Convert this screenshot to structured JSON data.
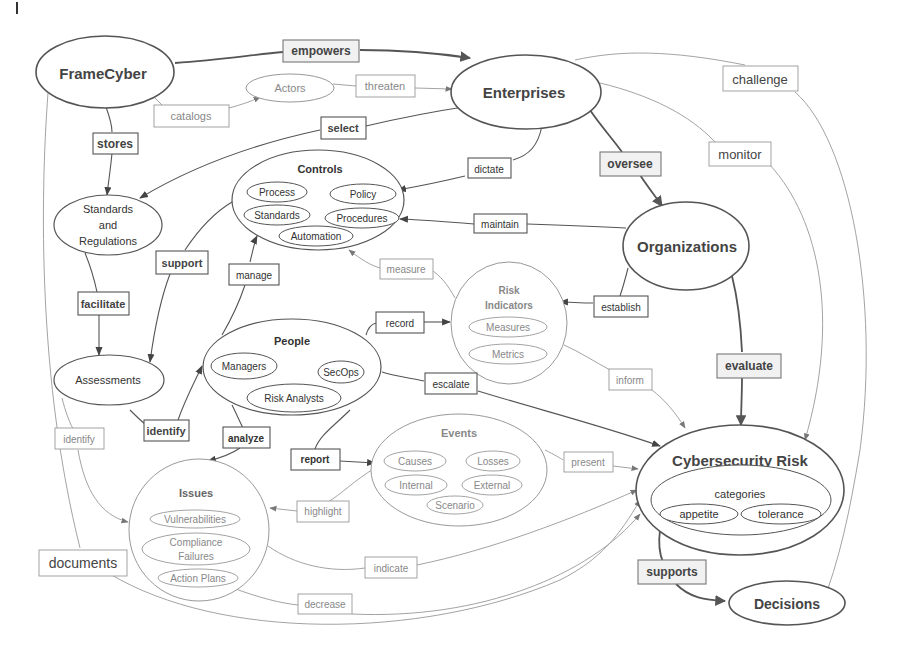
{
  "diagram": {
    "type": "concept-map",
    "nodes": {
      "framecyber": "FrameCyber",
      "enterprises": "Enterprises",
      "actors": "Actors",
      "standards_regs": [
        "Standards",
        "and",
        "Regulations"
      ],
      "controls": {
        "title": "Controls",
        "items": [
          "Process",
          "Policy",
          "Standards",
          "Procedures",
          "Automation"
        ]
      },
      "organizations": "Organizations",
      "risk_indicators": {
        "title": [
          "Risk",
          "Indicators"
        ],
        "items": [
          "Measures",
          "Metrics"
        ]
      },
      "assessments": "Assessments",
      "people": {
        "title": "People",
        "items": [
          "Managers",
          "SecOps",
          "Risk Analysts"
        ]
      },
      "events": {
        "title": "Events",
        "items": [
          "Causes",
          "Losses",
          "Internal",
          "External",
          "Scenario"
        ]
      },
      "issues": {
        "title": "Issues",
        "items": [
          "Vulnerabilities",
          "Compliance",
          "Failures",
          "Action Plans"
        ]
      },
      "cyber_risk": {
        "title": "Cybersecurity Risk",
        "sub_title": "categories",
        "items": [
          "appetite",
          "tolerance"
        ]
      },
      "decisions": "Decisions"
    },
    "edge_labels": {
      "empowers": "empowers",
      "catalogs": "catalogs",
      "threaten": "threaten",
      "stores": "stores",
      "select": "select",
      "challenge": "challenge",
      "dictate": "dictate",
      "oversee": "oversee",
      "monitor": "monitor",
      "maintain": "maintain",
      "support": "support",
      "manage": "manage",
      "measure": "measure",
      "facilitate": "facilitate",
      "establish": "establish",
      "record": "record",
      "escalate": "escalate",
      "inform": "inform",
      "evaluate": "evaluate",
      "identify_bold": "identify",
      "identify_light": "identify",
      "analyze": "analyze",
      "report": "report",
      "present": "present",
      "highlight": "highlight",
      "indicate": "indicate",
      "documents": "documents",
      "decrease": "decrease",
      "supports": "supports"
    }
  }
}
